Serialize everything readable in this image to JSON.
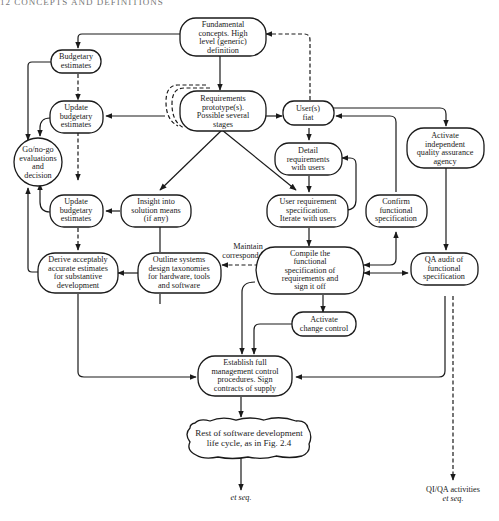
{
  "page_header": "12    CONCEPTS AND DEFINITIONS",
  "nodes": {
    "fundamental": {
      "lines": [
        "Fundamental",
        "concepts. High",
        "level (generic)",
        "definition"
      ]
    },
    "budgetary": {
      "lines": [
        "Budgetary",
        "estimates"
      ]
    },
    "prototype": {
      "lines": [
        "Requirements",
        "prototype(s).",
        "Possible several",
        "stages"
      ]
    },
    "fiat": {
      "lines": [
        "User(s)",
        "fiat"
      ]
    },
    "update1": {
      "lines": [
        "Update",
        "budgetary",
        "estimates"
      ]
    },
    "gonogo": {
      "lines": [
        "Go/no-go",
        "evaluations",
        "and",
        "decision"
      ]
    },
    "detail": {
      "lines": [
        "Detail",
        "requirements",
        "with users"
      ]
    },
    "activate_qa": {
      "lines": [
        "Activate",
        "independent",
        "quality assurance",
        "agency"
      ]
    },
    "update2": {
      "lines": [
        "Update",
        "budgetary",
        "estimates"
      ]
    },
    "insight": {
      "lines": [
        "Insight into",
        "solution means",
        "(if any)"
      ]
    },
    "user_spec": {
      "lines": [
        "User requirement",
        "specification.",
        "Iterate with users"
      ]
    },
    "confirm": {
      "lines": [
        "Confirm",
        "functional",
        "specification"
      ]
    },
    "derive": {
      "lines": [
        "Derive acceptably",
        "accurate estimates",
        "for substantive",
        "development"
      ]
    },
    "outline": {
      "lines": [
        "Outline systems",
        "design taxonomies",
        "for hardware, tools",
        "and software"
      ]
    },
    "compile": {
      "lines": [
        "Compile the",
        "functional",
        "specification of",
        "requirements and",
        "sign it off"
      ]
    },
    "qa_audit": {
      "lines": [
        "QA audit of",
        "functional",
        "specification"
      ]
    },
    "change_control": {
      "lines": [
        "Activate",
        "change control"
      ]
    },
    "establish": {
      "lines": [
        "Establish full",
        "management control",
        "procedures. Sign",
        "contracts of supply"
      ]
    },
    "rest": {
      "lines": [
        "Rest of software development",
        "life cycle, as in Fig. 2.4"
      ]
    }
  },
  "labels": {
    "maintain": [
      "Maintain",
      "correspondence"
    ],
    "et_seq_1": "et seq.",
    "qi_qa": "QI/QA activities",
    "et_seq_2": "et seq."
  }
}
